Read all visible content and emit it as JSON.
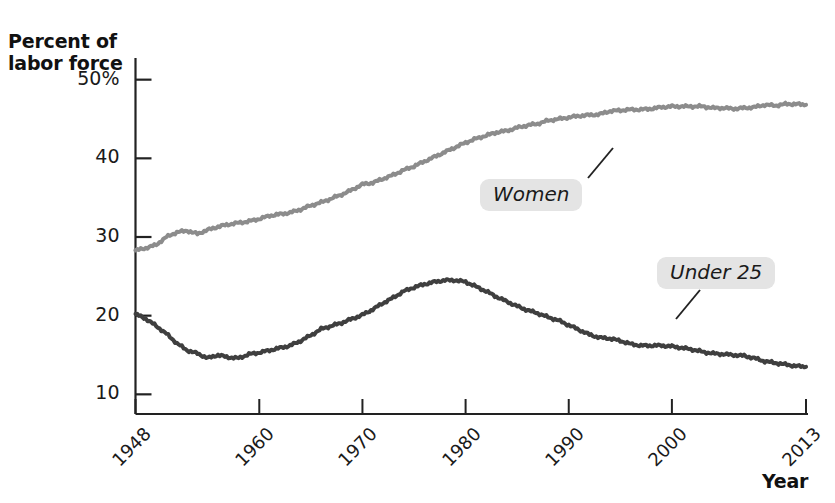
{
  "chart": {
    "y_axis_title": "Percent of\nlabor force",
    "x_axis_title": "Year"
  },
  "chart_data": {
    "type": "line",
    "title": "",
    "subtitle": "",
    "xlabel": "Year",
    "ylabel": "Percent of labor force",
    "xlim": [
      1948,
      2013
    ],
    "ylim": [
      7.5,
      52.5
    ],
    "grid": false,
    "legend_position": "inline-annotations",
    "xtick_labels": [
      "1948",
      "1960",
      "1970",
      "1980",
      "1990",
      "2000",
      "2013"
    ],
    "xticks": [
      1948,
      1960,
      1970,
      1980,
      1990,
      2000,
      2013
    ],
    "xtick_minor": [
      1950,
      1955,
      1965,
      1975,
      1985,
      1995,
      2005,
      2010
    ],
    "ytick_labels": [
      "50%",
      "40",
      "30",
      "20",
      "10"
    ],
    "yticks": [
      50,
      40,
      30,
      20,
      10
    ],
    "annotations": [
      {
        "text": "Women",
        "series": "Women",
        "point_year": 1991,
        "point_value": 45.8
      },
      {
        "text": "Under 25",
        "series": "Under 25",
        "point_year": 1997,
        "point_value": 16.2
      }
    ],
    "series": [
      {
        "name": "Women",
        "color": "#8c8c8c",
        "x": [
          1948,
          1949,
          1950,
          1951,
          1952,
          1953,
          1954,
          1955,
          1956,
          1957,
          1958,
          1959,
          1960,
          1961,
          1962,
          1963,
          1964,
          1965,
          1966,
          1967,
          1968,
          1969,
          1970,
          1971,
          1972,
          1973,
          1974,
          1975,
          1976,
          1977,
          1978,
          1979,
          1980,
          1981,
          1982,
          1983,
          1984,
          1985,
          1986,
          1987,
          1988,
          1989,
          1990,
          1991,
          1992,
          1993,
          1994,
          1995,
          1996,
          1997,
          1998,
          1999,
          2000,
          2001,
          2002,
          2003,
          2004,
          2005,
          2006,
          2007,
          2008,
          2009,
          2010,
          2011,
          2012,
          2013
        ],
        "values": [
          28.3,
          28.6,
          29.0,
          30.0,
          30.6,
          30.8,
          30.4,
          30.9,
          31.3,
          31.6,
          31.8,
          32.0,
          32.3,
          32.7,
          32.9,
          33.1,
          33.5,
          34.0,
          34.4,
          34.9,
          35.4,
          36.0,
          36.7,
          36.9,
          37.4,
          37.9,
          38.5,
          39.0,
          39.6,
          40.2,
          40.8,
          41.4,
          42.0,
          42.5,
          42.9,
          43.3,
          43.5,
          43.9,
          44.2,
          44.4,
          44.8,
          45.0,
          45.2,
          45.4,
          45.5,
          45.6,
          46.0,
          46.1,
          46.2,
          46.2,
          46.3,
          46.5,
          46.6,
          46.6,
          46.6,
          46.6,
          46.4,
          46.4,
          46.3,
          46.4,
          46.5,
          46.8,
          46.7,
          46.9,
          46.9,
          46.8
        ]
      },
      {
        "name": "Under 25",
        "color": "#3f3f3f",
        "x": [
          1948,
          1949,
          1950,
          1951,
          1952,
          1953,
          1954,
          1955,
          1956,
          1957,
          1958,
          1959,
          1960,
          1961,
          1962,
          1963,
          1964,
          1965,
          1966,
          1967,
          1968,
          1969,
          1970,
          1971,
          1972,
          1973,
          1974,
          1975,
          1976,
          1977,
          1978,
          1979,
          1980,
          1981,
          1982,
          1983,
          1984,
          1985,
          1986,
          1987,
          1988,
          1989,
          1990,
          1991,
          1992,
          1993,
          1994,
          1995,
          1996,
          1997,
          1998,
          1999,
          2000,
          2001,
          2002,
          2003,
          2004,
          2005,
          2006,
          2007,
          2008,
          2009,
          2010,
          2011,
          2012,
          2013
        ],
        "values": [
          20.2,
          19.6,
          18.7,
          17.7,
          16.5,
          15.6,
          15.2,
          14.6,
          15.0,
          14.7,
          14.6,
          15.1,
          15.3,
          15.6,
          15.9,
          16.2,
          16.8,
          17.5,
          18.3,
          18.7,
          19.1,
          19.6,
          20.1,
          20.8,
          21.6,
          22.3,
          23.1,
          23.6,
          24.0,
          24.3,
          24.5,
          24.5,
          24.3,
          23.7,
          23.1,
          22.4,
          21.8,
          21.2,
          20.7,
          20.3,
          19.8,
          19.4,
          18.8,
          18.2,
          17.6,
          17.2,
          17.1,
          16.8,
          16.4,
          16.2,
          16.2,
          16.2,
          16.1,
          15.9,
          15.7,
          15.4,
          15.2,
          15.1,
          15.0,
          14.9,
          14.6,
          14.2,
          14.0,
          13.8,
          13.6,
          13.5
        ]
      }
    ]
  }
}
